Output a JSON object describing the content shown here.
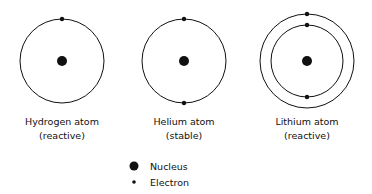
{
  "atoms": [
    {
      "name": "Hydrogen atom",
      "status": "(reactive)",
      "center": [
        62,
        61
      ],
      "shells": [
        {
          "radius": 42,
          "electron_angles": [
            270
          ]
        }
      ]
    },
    {
      "name": "Helium atom",
      "status": "(stable)",
      "center": [
        184,
        61
      ],
      "shells": [
        {
          "radius": 42,
          "electron_angles": [
            270,
            90
          ]
        }
      ]
    },
    {
      "name": "Lithium atom",
      "status": "(reactive)",
      "center": [
        307,
        61
      ],
      "shells": [
        {
          "radius": 36,
          "electron_angles": [
            270,
            90
          ]
        },
        {
          "radius": 47,
          "electron_angles": [
            270
          ]
        }
      ]
    }
  ],
  "legend": {
    "nucleus_label": "Nucleus",
    "electron_label": "Electron"
  },
  "colors": {
    "line": "#111111",
    "background": "#ffffff"
  }
}
